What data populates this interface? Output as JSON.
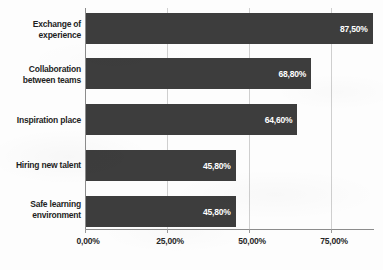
{
  "chart_data": {
    "type": "bar",
    "orientation": "horizontal",
    "title": "",
    "subtitle": "",
    "xlabel": "",
    "ylabel": "",
    "categories": [
      "Exchange of experience",
      "Collaboration between teams",
      "Inspiration place",
      "Hiring new talent",
      "Safe learning environment"
    ],
    "category_lines": [
      [
        "Exchange of",
        "experience"
      ],
      [
        "Collaboration",
        "between teams"
      ],
      [
        "Inspiration place"
      ],
      [
        "Hiring new talent"
      ],
      [
        "Safe learning",
        "environment"
      ]
    ],
    "values": [
      87.5,
      68.8,
      64.6,
      45.8,
      45.8
    ],
    "value_labels": [
      "87,50%",
      "68,80%",
      "64,60%",
      "45,80%",
      "45,80%"
    ],
    "xlim": [
      0,
      87.9
    ],
    "xticks": [
      0,
      25,
      50,
      75
    ],
    "xtick_labels": [
      "0,00%",
      "25,00%",
      "50,00%",
      "75,00%"
    ],
    "grid": true,
    "grid_axis": "x",
    "legend": "none",
    "bar_color": "#3d3d3d",
    "value_label_color": "#ffffff",
    "axis_color": "#8c8c8c",
    "grid_color": "#cfcfcf",
    "background_color": "#fdfdfd"
  }
}
